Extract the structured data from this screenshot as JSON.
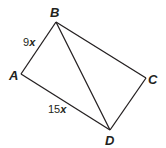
{
  "figure": {
    "type": "parallelogram with diagonal",
    "vertices": {
      "A": {
        "label": "A",
        "x": 21,
        "y": 74
      },
      "B": {
        "label": "B",
        "x": 56,
        "y": 22
      },
      "C": {
        "label": "C",
        "x": 146,
        "y": 78
      },
      "D": {
        "label": "D",
        "x": 110,
        "y": 130
      }
    },
    "segments": [
      "AB",
      "BC",
      "CD",
      "DA",
      "BD"
    ],
    "measures": {
      "AB": {
        "coef": "9",
        "var": "x"
      },
      "AD": {
        "coef": "15",
        "var": "x"
      }
    },
    "stroke_color": "#231f20"
  }
}
